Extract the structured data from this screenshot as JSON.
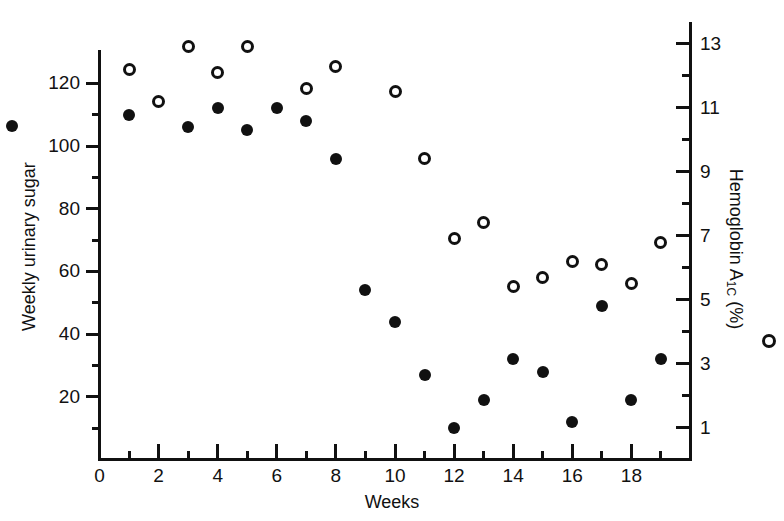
{
  "chart_data": {
    "type": "scatter",
    "title": "",
    "xlabel": "Weeks",
    "ylabel": "Weekly urinary sugar",
    "y2label": "Hemoglobin A1c (%)",
    "xlim": [
      0,
      20
    ],
    "ylim": [
      0,
      130
    ],
    "y2lim": [
      0,
      13.65
    ],
    "grid": false,
    "legend_position": "axis-labels",
    "x": [
      1,
      2,
      3,
      4,
      5,
      6,
      7,
      8,
      9,
      10,
      11,
      12,
      13,
      14,
      15,
      16,
      17,
      18,
      19
    ],
    "series": [
      {
        "name": "Weekly urinary sugar",
        "marker": "filled-circle",
        "axis": "left",
        "values": [
          110,
          null,
          106,
          112,
          105,
          112,
          108,
          96,
          54,
          44,
          27,
          10,
          19,
          32,
          28,
          12,
          49,
          19,
          32
        ]
      },
      {
        "name": "Hemoglobin A1c (%)",
        "marker": "open-circle",
        "axis": "right",
        "values": [
          12.2,
          11.2,
          12.9,
          12.1,
          12.9,
          null,
          11.6,
          12.3,
          null,
          11.5,
          9.4,
          6.9,
          7.4,
          5.4,
          5.7,
          6.2,
          6.1,
          5.5,
          6.8
        ]
      }
    ],
    "x_ticks_major": [
      0,
      2,
      4,
      6,
      8,
      10,
      12,
      14,
      16,
      18
    ],
    "x_ticks_minor": [
      1,
      3,
      5,
      7,
      9,
      11,
      13,
      15,
      17,
      19
    ],
    "y_left_ticks": [
      20,
      40,
      60,
      80,
      100,
      120
    ],
    "y_right_ticks": [
      1,
      3,
      5,
      7,
      9,
      11,
      13
    ]
  },
  "axes": {
    "x_title": "Weeks",
    "y_left_title": "Weekly urinary sugar",
    "y_right_title_main": "Hemoglobin A",
    "y_right_title_sub": "1C",
    "y_right_title_unit": " (%)",
    "x_origin_label": "0",
    "x_tick_labels": [
      "2",
      "4",
      "6",
      "8",
      "10",
      "12",
      "14",
      "16",
      "18"
    ],
    "y_left_tick_labels": [
      "120",
      "100",
      "80",
      "60",
      "40",
      "20"
    ],
    "y_right_tick_labels": [
      "13",
      "11",
      "9",
      "7",
      "5",
      "3",
      "1"
    ]
  },
  "colors": {
    "ink": "#111111",
    "background": "#ffffff"
  }
}
